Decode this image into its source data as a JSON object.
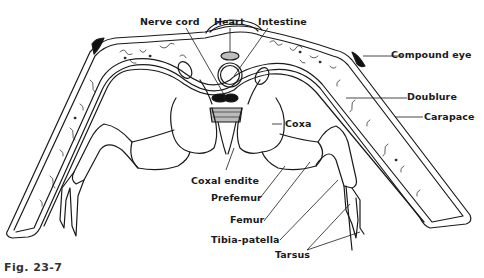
{
  "figure": {
    "caption": "Fig. 23-7",
    "colors": {
      "ink": "#1a1a1a",
      "background": "#ffffff",
      "shading": "#bdbdbd"
    }
  },
  "labels": {
    "nerve_cord": "Nerve cord",
    "heart": "Heart",
    "intestine": "Intestine",
    "compound_eye": "Compound eye",
    "doublure": "Doublure",
    "carapace": "Carapace",
    "coxa": "Coxa",
    "coxal_endite": "Coxal endite",
    "prefemur": "Prefemur",
    "femur": "Femur",
    "tibia_patella": "Tibia-patella",
    "tarsus": "Tarsus"
  }
}
